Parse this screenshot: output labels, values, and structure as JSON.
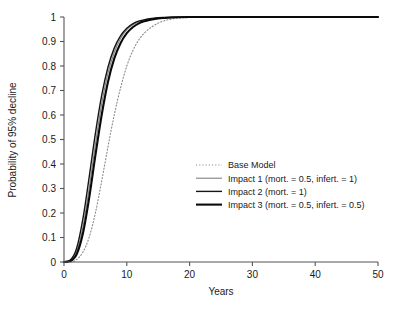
{
  "chart_data": {
    "type": "line",
    "title": "",
    "xlabel": "Years",
    "ylabel": "Probability of 95% decline",
    "xlim": [
      0,
      50
    ],
    "ylim": [
      0,
      1
    ],
    "xticks": [
      0,
      10,
      20,
      30,
      40,
      50
    ],
    "xticklabels": [
      "0",
      "10",
      "20",
      "30",
      "40",
      "50"
    ],
    "yticks": [
      0,
      0.1,
      0.2,
      0.3,
      0.4,
      0.5,
      0.6,
      0.7,
      0.8,
      0.9,
      1
    ],
    "yticklabels": [
      "0",
      "0.1",
      "0.2",
      "0.3",
      "0.4",
      "0.5",
      "0.6",
      "0.7",
      "0.8",
      "0.9",
      "1"
    ],
    "grid": false,
    "legend_position": "center-right",
    "series": [
      {
        "name": "Base Model",
        "style": "dotted",
        "color": "#888888",
        "width": 1.1,
        "x": [
          0,
          1,
          2,
          3,
          4,
          5,
          6,
          7,
          8,
          9,
          10,
          11,
          12,
          13,
          14,
          15,
          16,
          17,
          18,
          20,
          25,
          30,
          40,
          50
        ],
        "y": [
          0,
          0,
          0.01,
          0.04,
          0.1,
          0.2,
          0.33,
          0.47,
          0.6,
          0.71,
          0.8,
          0.865,
          0.91,
          0.94,
          0.96,
          0.975,
          0.985,
          0.991,
          0.995,
          0.998,
          1,
          1,
          1,
          1
        ]
      },
      {
        "name": "Impact 1 (mort. = 0.5, infert. = 1)",
        "style": "solid",
        "color": "#808080",
        "width": 1.1,
        "x": [
          0,
          1,
          2,
          3,
          4,
          5,
          6,
          7,
          8,
          9,
          10,
          11,
          12,
          13,
          14,
          15,
          16,
          18,
          20,
          25,
          30,
          40,
          50
        ],
        "y": [
          0,
          0.005,
          0.04,
          0.14,
          0.3,
          0.48,
          0.645,
          0.77,
          0.855,
          0.912,
          0.948,
          0.969,
          0.981,
          0.989,
          0.993,
          0.996,
          0.998,
          0.999,
          1,
          1,
          1,
          1,
          1
        ]
      },
      {
        "name": "Impact 2 (mort. = 1)",
        "style": "solid",
        "color": "#151515",
        "width": 1.4,
        "x": [
          0,
          1,
          2,
          3,
          4,
          5,
          6,
          7,
          8,
          9,
          10,
          11,
          12,
          13,
          14,
          15,
          16,
          18,
          20,
          25,
          30,
          40,
          50
        ],
        "y": [
          0,
          0.008,
          0.055,
          0.175,
          0.345,
          0.525,
          0.68,
          0.795,
          0.873,
          0.923,
          0.954,
          0.973,
          0.984,
          0.99,
          0.994,
          0.997,
          0.998,
          0.999,
          1,
          1,
          1,
          1,
          1
        ]
      },
      {
        "name": "Impact 3 (mort. = 0.5, infert. = 0.5)",
        "style": "solid",
        "color": "#0a0a0a",
        "width": 2.1,
        "x": [
          0,
          1,
          2,
          3,
          4,
          5,
          6,
          7,
          8,
          9,
          10,
          11,
          12,
          13,
          14,
          15,
          16,
          18,
          20,
          25,
          30,
          40,
          50
        ],
        "y": [
          0,
          0.004,
          0.03,
          0.115,
          0.26,
          0.435,
          0.6,
          0.735,
          0.83,
          0.893,
          0.934,
          0.959,
          0.975,
          0.984,
          0.99,
          0.994,
          0.996,
          0.999,
          1,
          1,
          1,
          1,
          1
        ]
      }
    ]
  }
}
